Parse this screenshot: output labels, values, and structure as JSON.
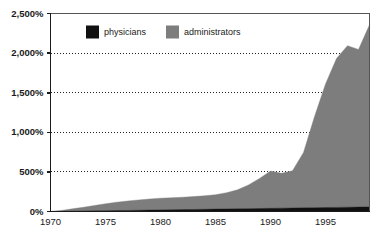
{
  "chart_data": {
    "type": "area",
    "title": "",
    "subtitle": "",
    "xlabel": "",
    "ylabel": "",
    "stacked": true,
    "grid": true,
    "grid_style": "dotted-horizontal",
    "legend_position": "top-inside-left",
    "xlim": [
      1970,
      1999
    ],
    "ylim": [
      0,
      2500
    ],
    "y_tick_labels": [
      "0%",
      "500%",
      "1,000%",
      "1,500%",
      "2,000%",
      "2,500%"
    ],
    "y_ticks": [
      0,
      500,
      1000,
      1500,
      2000,
      2500
    ],
    "x_tick_labels": [
      "1970",
      "1975",
      "1980",
      "1985",
      "1990",
      "1995"
    ],
    "x_ticks": [
      1970,
      1975,
      1980,
      1985,
      1990,
      1995
    ],
    "x": [
      1970,
      1971,
      1972,
      1973,
      1974,
      1975,
      1976,
      1977,
      1978,
      1979,
      1980,
      1981,
      1982,
      1983,
      1984,
      1985,
      1986,
      1987,
      1988,
      1989,
      1990,
      1991,
      1992,
      1993,
      1994,
      1995,
      1996,
      1997,
      1998,
      1999
    ],
    "series": [
      {
        "name": "physicians",
        "color": "#111111",
        "values": [
          0,
          2,
          4,
          6,
          8,
          10,
          12,
          14,
          16,
          18,
          20,
          22,
          24,
          26,
          28,
          30,
          32,
          34,
          36,
          38,
          40,
          42,
          44,
          46,
          48,
          50,
          52,
          54,
          56,
          58
        ]
      },
      {
        "name": "administrators",
        "color": "#7d7d7d",
        "values": [
          0,
          12,
          30,
          48,
          68,
          88,
          105,
          118,
          130,
          140,
          148,
          152,
          156,
          162,
          170,
          182,
          205,
          240,
          300,
          380,
          470,
          440,
          470,
          700,
          1150,
          1560,
          1880,
          2040,
          1990,
          2300
        ]
      }
    ],
    "legend": [
      {
        "label": "physicians",
        "color": "#111111"
      },
      {
        "label": "administrators",
        "color": "#7d7d7d"
      }
    ]
  },
  "style": {
    "background": "#ffffff",
    "axis_color": "#1a1a1a",
    "grid_color": "#222222",
    "plot_background": "#ffffff"
  }
}
